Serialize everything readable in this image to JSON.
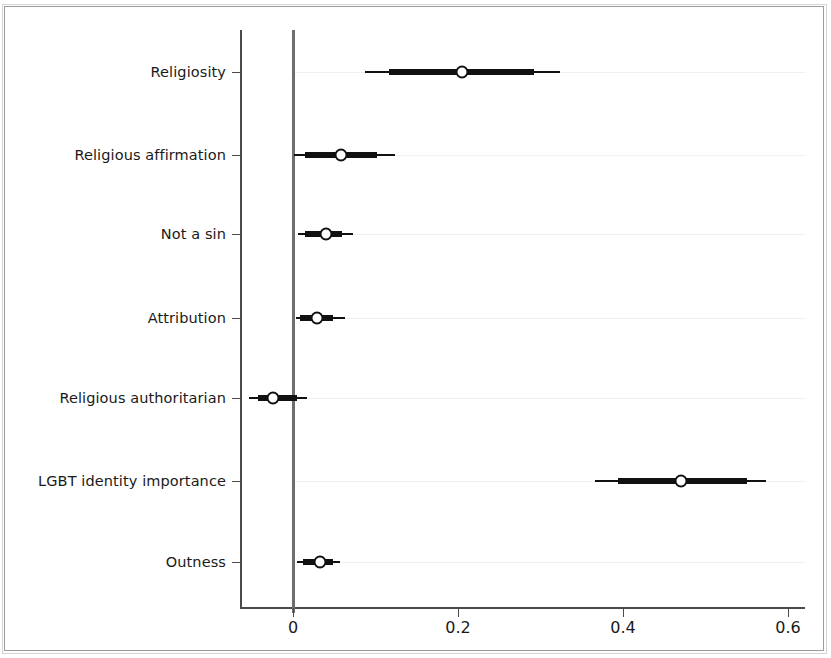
{
  "chart_data": {
    "type": "scatter",
    "subtype": "coefficient-forest-plot",
    "title": "",
    "xlabel": "",
    "ylabel": "",
    "xlim": [
      -0.065,
      0.63
    ],
    "ylim": [
      0,
      7
    ],
    "grid": "horizontal-dotted",
    "legend": "none",
    "zero_reference_line": 0,
    "x_ticks": [
      "0",
      "0.2",
      "0.4",
      "0.6"
    ],
    "x_tick_values": [
      0,
      0.2,
      0.4,
      0.6
    ],
    "categories": [
      "Religiosity",
      "Religious affirmation",
      "Not a sin",
      "Attribution",
      "Religious authoritarian",
      "LGBT identity importance",
      "Outness"
    ],
    "points": [
      {
        "label": "Religiosity",
        "estimate": 0.205,
        "inner_low": 0.116,
        "inner_high": 0.292,
        "outer_low": 0.087,
        "outer_high": 0.324
      },
      {
        "label": "Religious affirmation",
        "estimate": 0.058,
        "inner_low": 0.015,
        "inner_high": 0.102,
        "outer_low": 0.001,
        "outer_high": 0.124
      },
      {
        "label": "Not a sin",
        "estimate": 0.04,
        "inner_low": 0.015,
        "inner_high": 0.059,
        "outer_low": 0.006,
        "outer_high": 0.073
      },
      {
        "label": "Attribution",
        "estimate": 0.029,
        "inner_low": 0.009,
        "inner_high": 0.048,
        "outer_low": 0.004,
        "outer_high": 0.063
      },
      {
        "label": "Religious authoritarian",
        "estimate": -0.024,
        "inner_low": -0.042,
        "inner_high": 0.005,
        "outer_low": -0.053,
        "outer_high": 0.017
      },
      {
        "label": "LGBT identity importance",
        "estimate": 0.47,
        "inner_low": 0.394,
        "inner_high": 0.55,
        "outer_low": 0.366,
        "outer_high": 0.573
      },
      {
        "label": "Outness",
        "estimate": 0.033,
        "inner_low": 0.012,
        "inner_high": 0.048,
        "outer_low": 0.005,
        "outer_high": 0.057
      }
    ],
    "colors": {
      "marker": "#111111",
      "marker_fill": "#ffffff",
      "axis": "#4a4a4a",
      "zero_line": "#6e6e6e",
      "grid": "#f0f0f0",
      "background": "#ffffff",
      "frame": "#9b9b9b"
    }
  },
  "layout": {
    "x_pixel_zero": 293,
    "x_pixel_per_unit": 825,
    "axis_x_left": 240,
    "axis_x_right": 805,
    "axis_y_top": 30,
    "axis_y_bottom": 607,
    "row_y": [
      72,
      155,
      234,
      318,
      398,
      481,
      562
    ],
    "x_tick_label_y": 618
  }
}
